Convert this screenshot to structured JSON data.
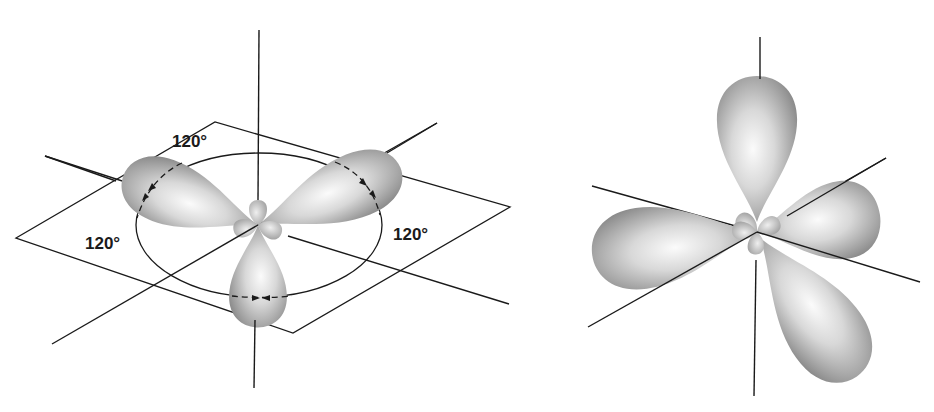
{
  "figures": [
    {
      "id": "trigonal-planar-sp2",
      "description": "Three sp2 hybrid orbitals in a plane at 120 degree angles",
      "angle_labels": [
        "120°",
        "120°",
        "120°"
      ],
      "lobe_count": 3
    },
    {
      "id": "tetrahedral-sp3",
      "description": "Four sp3 hybrid orbitals arranged tetrahedrally",
      "lobe_count": 4
    }
  ],
  "colors": {
    "lobe_light": "#f4f4f4",
    "lobe_dark": "#8a8a8a",
    "line": "#1a1a1a",
    "background": "#ffffff"
  }
}
